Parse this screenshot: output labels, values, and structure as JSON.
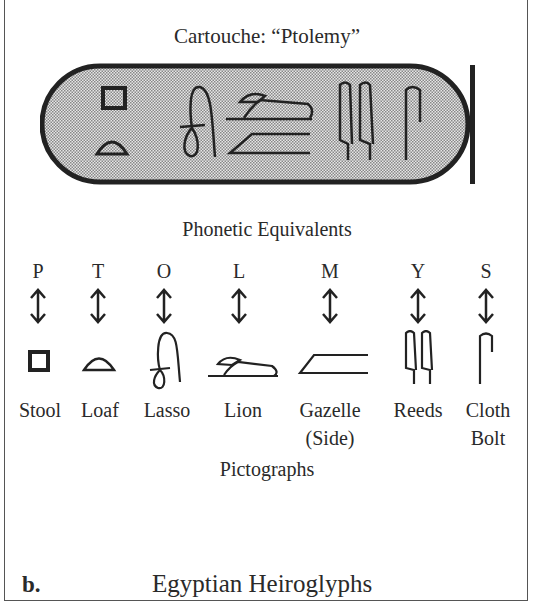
{
  "figure": {
    "title": "Cartouche: “Ptolemy”",
    "section_heading": "Phonetic Equivalents",
    "pictographs_label": "Pictographs",
    "panel_label": "b.",
    "caption": "Egyptian Heiroglyphs",
    "cartouche_fill": "#c8c8c8",
    "stroke_color": "#222222"
  },
  "glyphs": [
    {
      "letter": "P",
      "name": "Stool",
      "icon": "stool-icon"
    },
    {
      "letter": "T",
      "name": "Loaf",
      "icon": "loaf-icon"
    },
    {
      "letter": "O",
      "name": "Lasso",
      "icon": "lasso-icon"
    },
    {
      "letter": "L",
      "name": "Lion",
      "icon": "lion-icon"
    },
    {
      "letter": "M",
      "name": "Gazelle",
      "name2": "(Side)",
      "icon": "gazelle-side-icon"
    },
    {
      "letter": "Y",
      "name": "Reeds",
      "icon": "reeds-icon"
    },
    {
      "letter": "S",
      "name": "Cloth",
      "name2": "Bolt",
      "icon": "cloth-bolt-icon"
    }
  ]
}
